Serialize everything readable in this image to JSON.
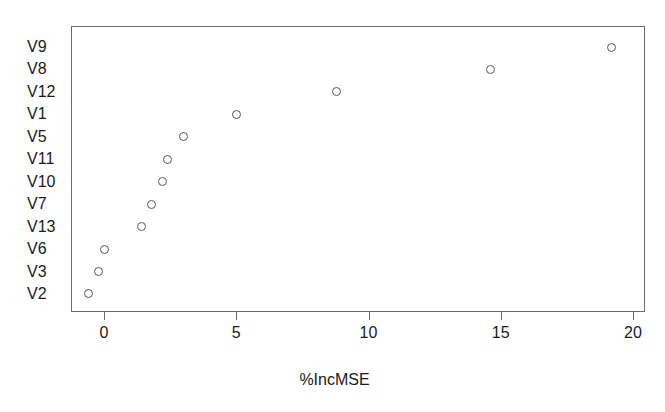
{
  "chart_data": {
    "type": "scatter",
    "title": "",
    "xlabel": "%IncMSE",
    "ylabel": "",
    "xlim": [
      -1.0,
      20.0
    ],
    "grid": false,
    "legend": null,
    "orientation": "horizontal-dotchart",
    "categories": [
      "V9",
      "V8",
      "V12",
      "V1",
      "V5",
      "V11",
      "V10",
      "V7",
      "V13",
      "V6",
      "V3",
      "V2"
    ],
    "values": [
      19.2,
      14.6,
      8.8,
      5.0,
      3.0,
      2.4,
      2.2,
      1.8,
      1.4,
      0.0,
      -0.2,
      -0.6
    ],
    "points": [
      {
        "label": "V9",
        "x": 19.2
      },
      {
        "label": "V8",
        "x": 14.6
      },
      {
        "label": "V12",
        "x": 8.8
      },
      {
        "label": "V1",
        "x": 5.0
      },
      {
        "label": "V5",
        "x": 3.0
      },
      {
        "label": "V11",
        "x": 2.4
      },
      {
        "label": "V10",
        "x": 2.2
      },
      {
        "label": "V7",
        "x": 1.8
      },
      {
        "label": "V13",
        "x": 1.4
      },
      {
        "label": "V6",
        "x": 0.0
      },
      {
        "label": "V3",
        "x": -0.2
      },
      {
        "label": "V2",
        "x": -0.6
      }
    ],
    "xticks": [
      0,
      5,
      10,
      15,
      20
    ],
    "xtick_labels": [
      "0",
      "5",
      "10",
      "15",
      "20"
    ],
    "marker": "open-circle",
    "marker_color": "#555555",
    "frame_color": "#6b6b6b",
    "background_color": "#ffffff"
  },
  "axes": {
    "x_title": "%IncMSE",
    "x_tick_labels": [
      "0",
      "5",
      "10",
      "15",
      "20"
    ],
    "y_category_labels": [
      "V9",
      "V8",
      "V12",
      "V1",
      "V5",
      "V11",
      "V10",
      "V7",
      "V13",
      "V6",
      "V3",
      "V2"
    ]
  }
}
